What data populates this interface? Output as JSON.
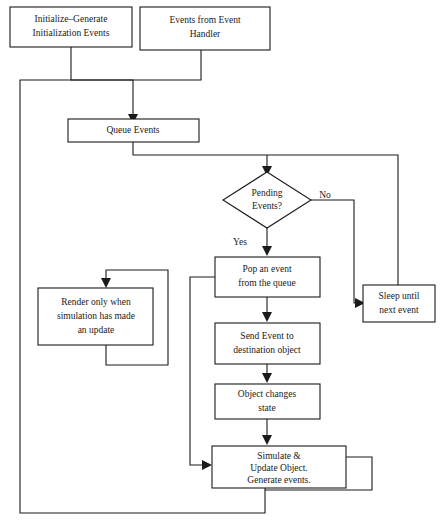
{
  "diagram": {
    "type": "flowchart",
    "colors": {
      "background": "#ffffff",
      "stroke": "#1a1a1a",
      "fill": "#ffffff"
    },
    "nodes": {
      "initialize": {
        "shape": "rectangle",
        "lines": [
          "Initialize–Generate",
          "Initialization Events"
        ]
      },
      "events_from_handler": {
        "shape": "rectangle",
        "lines": [
          "Events from Event",
          "Handler"
        ]
      },
      "queue_events": {
        "shape": "rectangle",
        "lines": [
          "Queue Events"
        ]
      },
      "pending_events": {
        "shape": "diamond",
        "lines": [
          "Pending",
          "Events?"
        ]
      },
      "sleep_until_next_event": {
        "shape": "rectangle",
        "lines": [
          "Sleep until",
          "next event"
        ]
      },
      "pop_event": {
        "shape": "rectangle",
        "lines": [
          "Pop an event",
          "from the queue"
        ]
      },
      "render_only": {
        "shape": "rectangle",
        "lines": [
          "Render only when",
          "simulation has made",
          "an update"
        ]
      },
      "send_event": {
        "shape": "rectangle",
        "lines": [
          "Send Event to",
          "destination object"
        ]
      },
      "object_changes_state": {
        "shape": "rectangle",
        "lines": [
          "Object changes",
          "state"
        ]
      },
      "simulate_update": {
        "shape": "rectangle",
        "lines": [
          "Simulate &",
          "Update Object.",
          "Generate events."
        ]
      }
    },
    "edge_labels": {
      "no": "No",
      "yes": "Yes"
    }
  }
}
